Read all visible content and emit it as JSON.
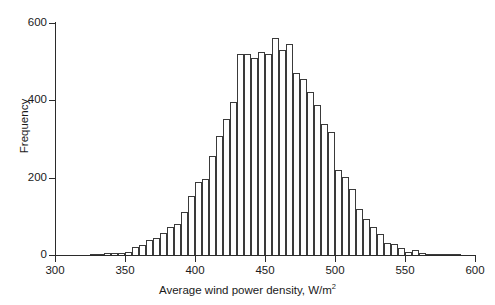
{
  "chart_data": {
    "type": "bar",
    "title": "",
    "subtitle": "",
    "xlabel": "Average wind power density, W/m",
    "xlabel_superscript": "2",
    "ylabel": "Frequency",
    "xlim": [
      300,
      600
    ],
    "ylim": [
      0,
      600
    ],
    "grid": false,
    "legend": null,
    "bin_width": 5,
    "xticks": [
      300,
      350,
      400,
      450,
      500,
      550,
      600
    ],
    "yticks": [
      0,
      200,
      400,
      600
    ],
    "bar_style": {
      "fill": "#ffffff",
      "edge": "#3a3a3a"
    },
    "bins": [
      {
        "x": 320,
        "value": 0
      },
      {
        "x": 325,
        "value": 3
      },
      {
        "x": 330,
        "value": 2
      },
      {
        "x": 335,
        "value": 5
      },
      {
        "x": 340,
        "value": 5
      },
      {
        "x": 345,
        "value": 6
      },
      {
        "x": 350,
        "value": 8
      },
      {
        "x": 355,
        "value": 22
      },
      {
        "x": 360,
        "value": 25
      },
      {
        "x": 365,
        "value": 38
      },
      {
        "x": 370,
        "value": 45
      },
      {
        "x": 375,
        "value": 58
      },
      {
        "x": 380,
        "value": 72
      },
      {
        "x": 385,
        "value": 80
      },
      {
        "x": 390,
        "value": 110
      },
      {
        "x": 395,
        "value": 152
      },
      {
        "x": 400,
        "value": 190
      },
      {
        "x": 405,
        "value": 196
      },
      {
        "x": 410,
        "value": 255
      },
      {
        "x": 415,
        "value": 308
      },
      {
        "x": 420,
        "value": 352
      },
      {
        "x": 425,
        "value": 396
      },
      {
        "x": 430,
        "value": 520
      },
      {
        "x": 435,
        "value": 520
      },
      {
        "x": 440,
        "value": 510
      },
      {
        "x": 445,
        "value": 525
      },
      {
        "x": 450,
        "value": 520
      },
      {
        "x": 455,
        "value": 560
      },
      {
        "x": 460,
        "value": 530
      },
      {
        "x": 465,
        "value": 545
      },
      {
        "x": 470,
        "value": 472
      },
      {
        "x": 475,
        "value": 455
      },
      {
        "x": 480,
        "value": 422
      },
      {
        "x": 485,
        "value": 388
      },
      {
        "x": 490,
        "value": 340
      },
      {
        "x": 495,
        "value": 318
      },
      {
        "x": 500,
        "value": 220
      },
      {
        "x": 505,
        "value": 202
      },
      {
        "x": 510,
        "value": 172
      },
      {
        "x": 515,
        "value": 120
      },
      {
        "x": 520,
        "value": 92
      },
      {
        "x": 525,
        "value": 72
      },
      {
        "x": 530,
        "value": 55
      },
      {
        "x": 535,
        "value": 30
      },
      {
        "x": 540,
        "value": 28
      },
      {
        "x": 545,
        "value": 18
      },
      {
        "x": 550,
        "value": 7
      },
      {
        "x": 555,
        "value": 14
      },
      {
        "x": 560,
        "value": 4
      },
      {
        "x": 565,
        "value": 3
      },
      {
        "x": 570,
        "value": 2
      },
      {
        "x": 575,
        "value": 3
      },
      {
        "x": 580,
        "value": 3
      },
      {
        "x": 585,
        "value": 1
      }
    ]
  }
}
